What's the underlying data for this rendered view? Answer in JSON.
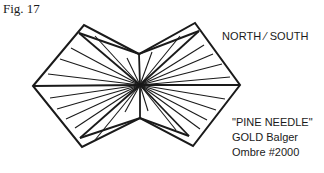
{
  "figure": {
    "label": "Fig. 17",
    "direction_label": "NORTH ⁄ SOUTH",
    "pattern_name": "\"PINE NEEDLE\"",
    "thread_line1": "GOLD Balger",
    "thread_line2": "Ombre #2000",
    "stroke_color": "#1a1a1a",
    "center": [
      140,
      85
    ],
    "outline": [
      [
        33,
        86
      ],
      [
        84,
        25
      ],
      [
        139,
        54
      ],
      [
        195,
        23
      ],
      [
        240,
        85
      ],
      [
        193,
        146
      ],
      [
        140,
        118
      ],
      [
        82,
        147
      ]
    ],
    "inner_outline": [
      [
        79,
        33
      ],
      [
        139,
        54
      ],
      [
        199,
        31
      ]
    ],
    "inner_outline_bottom": [
      [
        80,
        138
      ],
      [
        140,
        118
      ],
      [
        189,
        136
      ]
    ],
    "radial_endpoints_thick": [
      [
        79,
        33
      ],
      [
        199,
        31
      ],
      [
        80,
        138
      ],
      [
        189,
        136
      ],
      [
        33,
        86
      ],
      [
        240,
        85
      ],
      [
        139,
        54
      ],
      [
        140,
        118
      ]
    ],
    "radial_endpoints_thin": [
      [
        95,
        36
      ],
      [
        71,
        48
      ],
      [
        60,
        59
      ],
      [
        48,
        74
      ],
      [
        50,
        98
      ],
      [
        57,
        109
      ],
      [
        66,
        119
      ],
      [
        75,
        128
      ],
      [
        95,
        140
      ],
      [
        127,
        58
      ],
      [
        152,
        52
      ],
      [
        180,
        36
      ],
      [
        204,
        45
      ],
      [
        213,
        54
      ],
      [
        222,
        64
      ],
      [
        230,
        77
      ],
      [
        225,
        99
      ],
      [
        216,
        110
      ],
      [
        207,
        120
      ],
      [
        200,
        129
      ],
      [
        176,
        130
      ],
      [
        125,
        112
      ],
      [
        148,
        111
      ]
    ]
  }
}
